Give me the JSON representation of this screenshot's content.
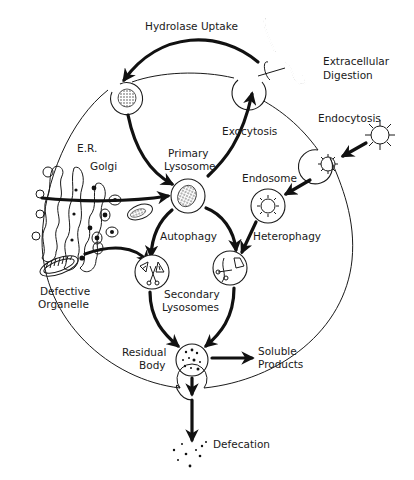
{
  "diagram": {
    "labels": {
      "hydrolase_uptake": "Hydrolase Uptake",
      "extracellular_digestion_1": "Extracellular",
      "extracellular_digestion_2": "Digestion",
      "endocytosis": "Endocytosis",
      "exocytosis": "Exocytosis",
      "er": "E.R.",
      "golgi": "Golgi",
      "primary_lysosome_1": "Primary",
      "primary_lysosome_2": "Lysosome",
      "endosome": "Endosome",
      "autophagy": "Autophagy",
      "heterophagy": "Heterophagy",
      "defective_organelle_1": "Defective",
      "defective_organelle_2": "Organelle",
      "secondary_lysosomes_1": "Secondary",
      "secondary_lysosomes_2": "Lysosomes",
      "residual_body_1": "Residual",
      "residual_body_2": "Body",
      "soluble_products_1": "Soluble",
      "soluble_products_2": "Products",
      "defecation": "Defecation"
    },
    "edges": [
      {
        "from": "Extracellular Digestion",
        "to": "Hydrolase Uptake vesicle",
        "label": "Hydrolase Uptake"
      },
      {
        "from": "Hydrolase Uptake vesicle",
        "to": "Primary Lysosome"
      },
      {
        "from": "Golgi",
        "to": "Primary Lysosome"
      },
      {
        "from": "Primary Lysosome",
        "to": "Exocytosis vesicle",
        "label": "Exocytosis"
      },
      {
        "from": "Endocytosis",
        "to": "Endocytic vesicle"
      },
      {
        "from": "Endocytic vesicle",
        "to": "Endosome"
      },
      {
        "from": "Endosome",
        "to": "Heterophagy lysosome",
        "label": "Heterophagy"
      },
      {
        "from": "Primary Lysosome",
        "to": "Autophagy lysosome",
        "label": "Autophagy"
      },
      {
        "from": "Primary Lysosome",
        "to": "Heterophagy lysosome"
      },
      {
        "from": "Defective Organelle",
        "to": "Autophagy lysosome"
      },
      {
        "from": "Secondary Lysosomes",
        "to": "Residual Body"
      },
      {
        "from": "Residual Body",
        "to": "Soluble Products"
      },
      {
        "from": "Residual Body",
        "to": "Defecation"
      }
    ]
  }
}
